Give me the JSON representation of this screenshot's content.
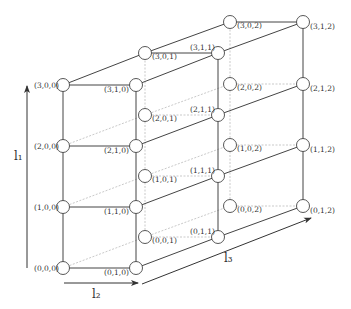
{
  "diagram": {
    "type": "3d-lattice",
    "dims": [
      4,
      2,
      3
    ],
    "colors": {
      "solid": "#444444",
      "hidden": "#bbbbbb",
      "node_fill": "#ffffff",
      "node_stroke": "#444444",
      "text": "#333333"
    },
    "axes": [
      {
        "id": "l1",
        "label": "l₁",
        "from": [
          27,
          268
        ],
        "to": [
          27,
          86
        ],
        "label_pos": [
          14,
          160
        ]
      },
      {
        "id": "l2",
        "label": "l₂",
        "from": [
          64,
          283
        ],
        "to": [
          138,
          283
        ],
        "label_pos": [
          92,
          298
        ]
      },
      {
        "id": "l3",
        "label": "l₃",
        "from": [
          142,
          284
        ],
        "to": [
          311,
          218
        ],
        "label_pos": [
          224,
          262
        ]
      }
    ],
    "nodes": [
      {
        "id": "0,0,0",
        "label": "(0,0,0)",
        "x": 63,
        "y": 268,
        "lx": 34,
        "ly": 271
      },
      {
        "id": "1,0,0",
        "label": "(1,0,0)",
        "x": 63,
        "y": 207,
        "lx": 34,
        "ly": 210
      },
      {
        "id": "2,0,0",
        "label": "(2,0,0)",
        "x": 63,
        "y": 146,
        "lx": 34,
        "ly": 149
      },
      {
        "id": "3,0,0",
        "label": "(3,0,0)",
        "x": 63,
        "y": 85,
        "lx": 34,
        "ly": 88
      },
      {
        "id": "0,1,0",
        "label": "(0,1,0)",
        "x": 136,
        "y": 268,
        "lx": 104,
        "ly": 275
      },
      {
        "id": "1,1,0",
        "label": "(1,1,0)",
        "x": 136,
        "y": 207,
        "lx": 104,
        "ly": 214
      },
      {
        "id": "2,1,0",
        "label": "(2,1,0)",
        "x": 136,
        "y": 146,
        "lx": 104,
        "ly": 153
      },
      {
        "id": "3,1,0",
        "label": "(3,1,0)",
        "x": 136,
        "y": 85,
        "lx": 104,
        "ly": 92
      },
      {
        "id": "0,0,1",
        "label": "(0,0,1)",
        "x": 145,
        "y": 237,
        "lx": 152,
        "ly": 243
      },
      {
        "id": "1,0,1",
        "label": "(1,0,1)",
        "x": 145,
        "y": 176,
        "lx": 152,
        "ly": 182
      },
      {
        "id": "2,0,1",
        "label": "(2,0,1)",
        "x": 145,
        "y": 115,
        "lx": 152,
        "ly": 121
      },
      {
        "id": "3,0,1",
        "label": "(3,0,1)",
        "x": 145,
        "y": 53,
        "lx": 152,
        "ly": 59
      },
      {
        "id": "0,1,1",
        "label": "(0,1,1)",
        "x": 218,
        "y": 237,
        "lx": 190,
        "ly": 234
      },
      {
        "id": "1,1,1",
        "label": "(1,1,1)",
        "x": 218,
        "y": 176,
        "lx": 190,
        "ly": 173
      },
      {
        "id": "2,1,1",
        "label": "(2,1,1)",
        "x": 218,
        "y": 115,
        "lx": 190,
        "ly": 112
      },
      {
        "id": "3,1,1",
        "label": "(3,1,1)",
        "x": 218,
        "y": 53,
        "lx": 190,
        "ly": 50
      },
      {
        "id": "0,0,2",
        "label": "(0,0,2)",
        "x": 230,
        "y": 206,
        "lx": 237,
        "ly": 212
      },
      {
        "id": "1,0,2",
        "label": "(1,0,2)",
        "x": 230,
        "y": 145,
        "lx": 237,
        "ly": 151
      },
      {
        "id": "2,0,2",
        "label": "(2,0,2)",
        "x": 230,
        "y": 84,
        "lx": 237,
        "ly": 90
      },
      {
        "id": "3,0,2",
        "label": "(3,0,2)",
        "x": 230,
        "y": 22,
        "lx": 237,
        "ly": 28
      },
      {
        "id": "0,1,2",
        "label": "(0,1,2)",
        "x": 303,
        "y": 206,
        "lx": 310,
        "ly": 213
      },
      {
        "id": "1,1,2",
        "label": "(1,1,2)",
        "x": 303,
        "y": 145,
        "lx": 310,
        "ly": 152
      },
      {
        "id": "2,1,2",
        "label": "(2,1,2)",
        "x": 303,
        "y": 84,
        "lx": 310,
        "ly": 91
      },
      {
        "id": "3,1,2",
        "label": "(3,1,2)",
        "x": 303,
        "y": 22,
        "lx": 310,
        "ly": 29
      }
    ]
  }
}
